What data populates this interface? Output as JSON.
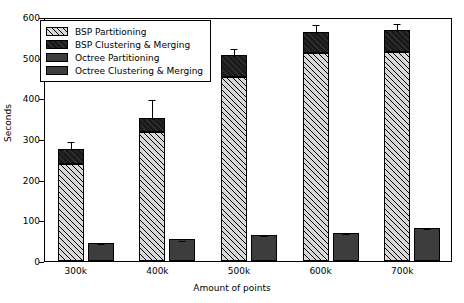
{
  "chart_data": {
    "type": "bar",
    "title": "",
    "xlabel": "Amount of points",
    "ylabel": "Seconds",
    "categories": [
      "300k",
      "400k",
      "500k",
      "600k",
      "700k"
    ],
    "ylim": [
      0,
      600
    ],
    "yticks": [
      0,
      100,
      200,
      300,
      400,
      500,
      600
    ],
    "grid": false,
    "stacked": true,
    "legend_position": "upper left",
    "series": [
      {
        "name": "BSP Partitioning",
        "style": "hatched",
        "color": "#d8d8d8",
        "values": [
          238,
          317,
          452,
          512,
          515
        ]
      },
      {
        "name": "BSP Clustering & Merging",
        "style": "solid",
        "color": "#1a1a1a",
        "values": [
          37,
          35,
          55,
          51,
          53
        ]
      },
      {
        "name": "Octree Partitioning",
        "style": "solid",
        "color": "#3d3d3d",
        "values": [
          0,
          0,
          0,
          0,
          0
        ]
      },
      {
        "name": "Octree Clustering & Merging",
        "style": "solid",
        "color": "#3d3d3d",
        "values": [
          44,
          53,
          65,
          70,
          81
        ]
      }
    ],
    "bsp_totals": [
      275,
      352,
      507,
      563,
      568
    ],
    "octree_totals": [
      44,
      53,
      65,
      70,
      81
    ],
    "bsp_errors": [
      22,
      50,
      20,
      22,
      20
    ],
    "octree_errors": [
      2,
      2,
      2,
      2,
      2
    ]
  },
  "legend": {
    "items": [
      "BSP Partitioning",
      "BSP Clustering & Merging",
      "Octree Partitioning",
      "Octree Clustering & Merging"
    ]
  },
  "axes": {
    "y_label": "Seconds",
    "x_label": "Amount of points",
    "y_ticks": [
      "0",
      "100",
      "200",
      "300",
      "400",
      "500",
      "600"
    ],
    "x_ticks": [
      "300k",
      "400k",
      "500k",
      "600k",
      "700k"
    ]
  }
}
